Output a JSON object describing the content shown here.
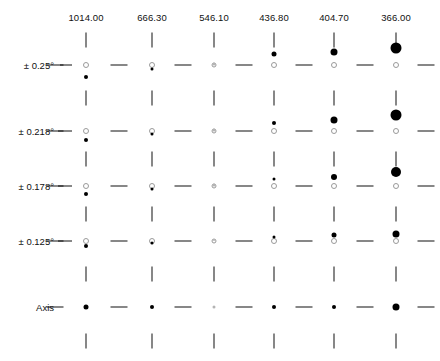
{
  "chart_data": {
    "type": "scatter",
    "title": "",
    "xlabel": "",
    "ylabel": "",
    "grid": false,
    "legend": null,
    "categories": [
      "1014.00",
      "666.30",
      "546.10",
      "436.80",
      "404.70",
      "366.00"
    ],
    "row_categories": [
      "± 0.25°",
      "± 0.218°",
      "± 0.178°",
      "± 0.125°",
      "Axis"
    ],
    "column_positions_px": [
      86,
      152,
      214,
      274,
      334,
      396
    ],
    "row_baseline_px": [
      65,
      131,
      186,
      241,
      307
    ],
    "series": [
      {
        "name": "± 0.25°",
        "row": 0,
        "points": [
          {
            "x": "1014.00",
            "open_marker": {
              "size": 4,
              "offset": 0
            },
            "filled_marker": {
              "size": 4,
              "offset": -12
            }
          },
          {
            "x": "666.30",
            "open_marker": {
              "size": 4,
              "offset": 0
            },
            "filled_marker": {
              "size": 3,
              "offset": -4
            }
          },
          {
            "x": "546.10",
            "open_marker": {
              "size": 3,
              "offset": 0
            },
            "filled_marker": {
              "size": 3,
              "offset": 1
            }
          },
          {
            "x": "436.80",
            "open_marker": {
              "size": 4,
              "offset": 0
            },
            "filled_marker": {
              "size": 5,
              "offset": 11
            }
          },
          {
            "x": "404.70",
            "open_marker": {
              "size": 4,
              "offset": 0
            },
            "filled_marker": {
              "size": 7,
              "offset": 13
            }
          },
          {
            "x": "366.00",
            "open_marker": {
              "size": 4,
              "offset": 0
            },
            "filled_marker": {
              "size": 11,
              "offset": 17
            }
          }
        ]
      },
      {
        "name": "± 0.218°",
        "row": 1,
        "points": [
          {
            "x": "1014.00",
            "open_marker": {
              "size": 4,
              "offset": 0
            },
            "filled_marker": {
              "size": 4,
              "offset": -9
            }
          },
          {
            "x": "666.30",
            "open_marker": {
              "size": 4,
              "offset": 0
            },
            "filled_marker": {
              "size": 3,
              "offset": -3
            }
          },
          {
            "x": "546.10",
            "open_marker": {
              "size": 3,
              "offset": 0
            },
            "filled_marker": {
              "size": 3,
              "offset": 1
            }
          },
          {
            "x": "436.80",
            "open_marker": {
              "size": 4,
              "offset": 0
            },
            "filled_marker": {
              "size": 4,
              "offset": 8
            }
          },
          {
            "x": "404.70",
            "open_marker": {
              "size": 4,
              "offset": 0
            },
            "filled_marker": {
              "size": 7,
              "offset": 11
            }
          },
          {
            "x": "366.00",
            "open_marker": {
              "size": 4,
              "offset": 0
            },
            "filled_marker": {
              "size": 11,
              "offset": 16
            }
          }
        ]
      },
      {
        "name": "± 0.178°",
        "row": 2,
        "points": [
          {
            "x": "1014.00",
            "open_marker": {
              "size": 4,
              "offset": 0
            },
            "filled_marker": {
              "size": 4,
              "offset": -8
            }
          },
          {
            "x": "666.30",
            "open_marker": {
              "size": 4,
              "offset": 0
            },
            "filled_marker": {
              "size": 3,
              "offset": -3
            }
          },
          {
            "x": "546.10",
            "open_marker": {
              "size": 3,
              "offset": 0
            },
            "filled_marker": {
              "size": 3,
              "offset": 1
            }
          },
          {
            "x": "436.80",
            "open_marker": {
              "size": 4,
              "offset": 0
            },
            "filled_marker": {
              "size": 3,
              "offset": 7
            }
          },
          {
            "x": "404.70",
            "open_marker": {
              "size": 4,
              "offset": 0
            },
            "filled_marker": {
              "size": 6,
              "offset": 9
            }
          },
          {
            "x": "366.00",
            "open_marker": {
              "size": 4,
              "offset": 0
            },
            "filled_marker": {
              "size": 10,
              "offset": 14
            }
          }
        ]
      },
      {
        "name": "± 0.125°",
        "row": 3,
        "points": [
          {
            "x": "1014.00",
            "open_marker": {
              "size": 4,
              "offset": 0
            },
            "filled_marker": {
              "size": 4,
              "offset": -5
            }
          },
          {
            "x": "666.30",
            "open_marker": {
              "size": 4,
              "offset": 0
            },
            "filled_marker": {
              "size": 3,
              "offset": -2
            }
          },
          {
            "x": "546.10",
            "open_marker": {
              "size": 3,
              "offset": 0
            },
            "filled_marker": {
              "size": 2,
              "offset": 1
            }
          },
          {
            "x": "436.80",
            "open_marker": {
              "size": 4,
              "offset": 0
            },
            "filled_marker": {
              "size": 3,
              "offset": 4
            }
          },
          {
            "x": "404.70",
            "open_marker": {
              "size": 4,
              "offset": 0
            },
            "filled_marker": {
              "size": 5,
              "offset": 6
            }
          },
          {
            "x": "366.00",
            "open_marker": {
              "size": 4,
              "offset": 0
            },
            "filled_marker": {
              "size": 7,
              "offset": 7
            }
          }
        ]
      },
      {
        "name": "Axis",
        "row": 4,
        "points": [
          {
            "x": "1014.00",
            "open_marker": null,
            "filled_marker": {
              "size": 5,
              "offset": 0
            }
          },
          {
            "x": "666.30",
            "open_marker": null,
            "filled_marker": {
              "size": 4,
              "offset": 0
            }
          },
          {
            "x": "546.10",
            "open_marker": null,
            "filled_marker": {
              "size": 3,
              "offset": 0
            }
          },
          {
            "x": "436.80",
            "open_marker": null,
            "filled_marker": {
              "size": 4,
              "offset": 0
            }
          },
          {
            "x": "404.70",
            "open_marker": null,
            "filled_marker": {
              "size": 4,
              "offset": 0
            }
          },
          {
            "x": "366.00",
            "open_marker": null,
            "filled_marker": {
              "size": 7,
              "offset": 0
            }
          }
        ]
      }
    ]
  }
}
